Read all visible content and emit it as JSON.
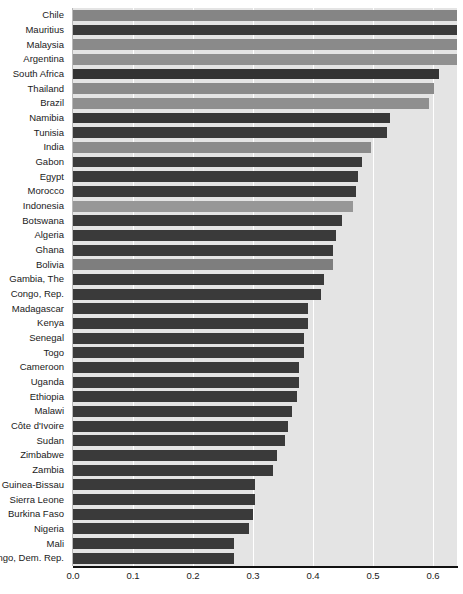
{
  "chart_data": {
    "type": "bar",
    "orientation": "horizontal",
    "title": "",
    "subtitle": "",
    "xlabel": "",
    "ylabel": "",
    "xlim": [
      0.0,
      0.8
    ],
    "ylim": null,
    "grid": true,
    "grid_axis": "x",
    "legend": false,
    "legend_position": "none",
    "x_ticks": [
      "0.0",
      "0.1",
      "0.2",
      "0.3",
      "0.4",
      "0.5",
      "0.6",
      "0.7",
      "0.8"
    ],
    "x_tick_values": [
      0.0,
      0.1,
      0.2,
      0.3,
      0.4,
      0.5,
      0.6,
      0.7,
      0.8
    ],
    "categories": [
      "Chile",
      "Mauritius",
      "Malaysia",
      "Argentina",
      "South Africa",
      "Thailand",
      "Brazil",
      "Namibia",
      "Tunisia",
      "India",
      "Gabon",
      "Egypt",
      "Morocco",
      "Indonesia",
      "Botswana",
      "Algeria",
      "Ghana",
      "Bolivia",
      "Gambia, The",
      "Congo, Rep.",
      "Madagascar",
      "Kenya",
      "Senegal",
      "Togo",
      "Cameroon",
      "Uganda",
      "Ethiopia",
      "Malawi",
      "Côte d'Ivoire",
      "Sudan",
      "Zimbabwe",
      "Zambia",
      "Guinea-Bissau",
      "Sierra Leone",
      "Burkina Faso",
      "Nigeria",
      "Mali",
      "Congo, Dem. Rep."
    ],
    "values": [
      0.673,
      0.665,
      0.665,
      0.652,
      0.61,
      0.602,
      0.594,
      0.529,
      0.523,
      0.496,
      0.481,
      0.475,
      0.471,
      0.467,
      0.448,
      0.438,
      0.433,
      0.433,
      0.419,
      0.413,
      0.392,
      0.392,
      0.385,
      0.385,
      0.377,
      0.377,
      0.373,
      0.365,
      0.358,
      0.354,
      0.34,
      0.333,
      0.304,
      0.304,
      0.3,
      0.294,
      0.269,
      0.269
    ],
    "bar_colors": [
      "#858585",
      "#3b3b3b",
      "#8a8a8a",
      "#909090",
      "#333333",
      "#8a8a8a",
      "#8f8f8f",
      "#373737",
      "#3a3a3a",
      "#8b8b8b",
      "#3a3a3a",
      "#3a3a3a",
      "#3a3a3a",
      "#979797",
      "#3a3a3a",
      "#3a3a3a",
      "#3a3a3a",
      "#7e7e7e",
      "#3a3a3a",
      "#3a3a3a",
      "#3a3a3a",
      "#3a3a3a",
      "#3a3a3a",
      "#3a3a3a",
      "#3a3a3a",
      "#3a3a3a",
      "#3a3a3a",
      "#3a3a3a",
      "#3a3a3a",
      "#3a3a3a",
      "#3a3a3a",
      "#3a3a3a",
      "#3a3a3a",
      "#3a3a3a",
      "#3a3a3a",
      "#3a3a3a",
      "#3a3a3a",
      "#3a3a3a"
    ],
    "colors": {
      "plot_background": "#e4e4e4",
      "gridline": "#ffffff",
      "axis_line": "#111111",
      "tick_label": "#1a1a1a",
      "bar_dark": "#3a3a3a",
      "bar_light": "#8a8a8a"
    }
  }
}
